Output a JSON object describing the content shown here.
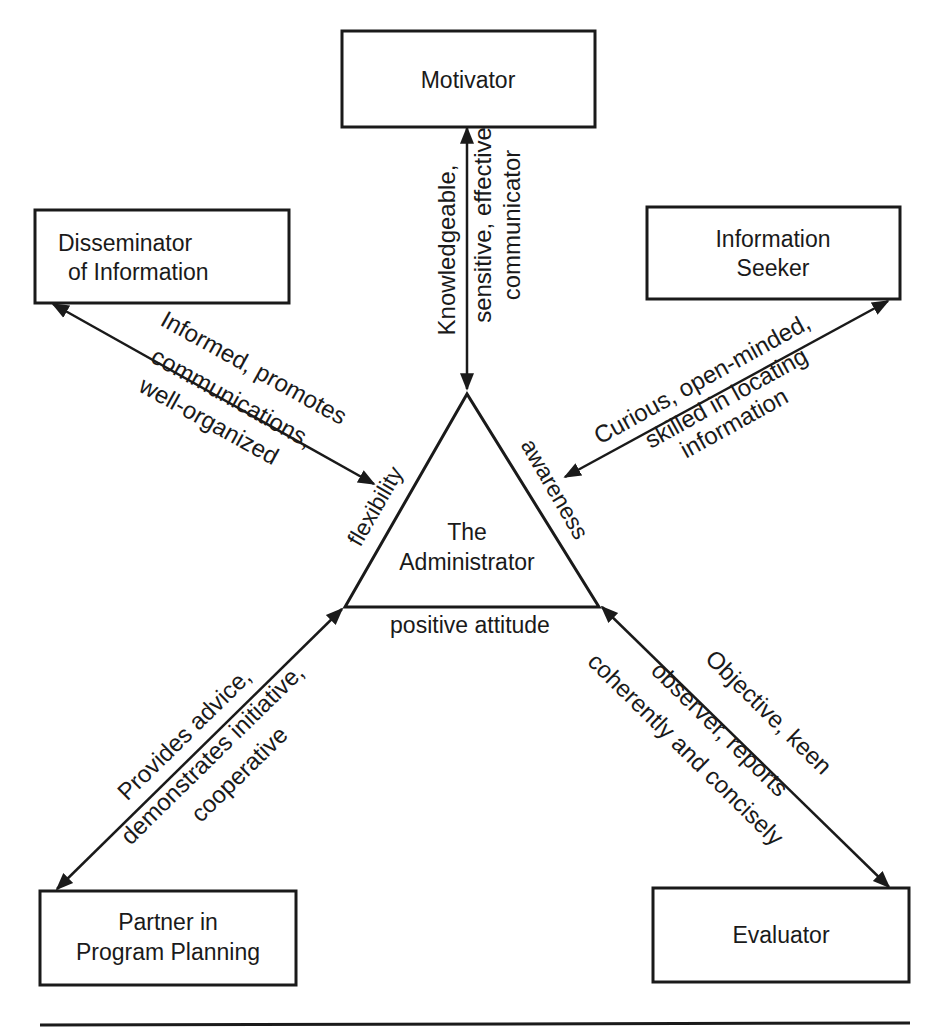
{
  "diagram": {
    "center": {
      "title_line1": "The",
      "title_line2": "Administrator",
      "sides": {
        "left": "flexibility",
        "right": "awareness",
        "bottom": "positive attitude"
      }
    },
    "nodes": {
      "motivator": {
        "label": "Motivator"
      },
      "disseminator": {
        "line1": "Disseminator",
        "line2": "of Information"
      },
      "seeker": {
        "line1": "Information",
        "line2": "Seeker"
      },
      "partner": {
        "line1": "Partner in",
        "line2": "Program Planning"
      },
      "evaluator": {
        "label": "Evaluator"
      }
    },
    "edges": {
      "motivator": {
        "line1": "Knowledgeable,",
        "line2": "sensitive, effective",
        "line3": "communicator"
      },
      "disseminator": {
        "line1": "Informed, promotes",
        "line2": "communications,",
        "line3": "well-organized"
      },
      "seeker": {
        "line1": "Curious, open-minded,",
        "line2": "skilled in locating",
        "line3": "information"
      },
      "partner": {
        "line1": "Provides advice,",
        "line2": "demonstrates initiative,",
        "line3": "cooperative"
      },
      "evaluator": {
        "line1": "Objective, keen",
        "line2": "observer, reports",
        "line3": "coherently and concisely"
      }
    }
  }
}
